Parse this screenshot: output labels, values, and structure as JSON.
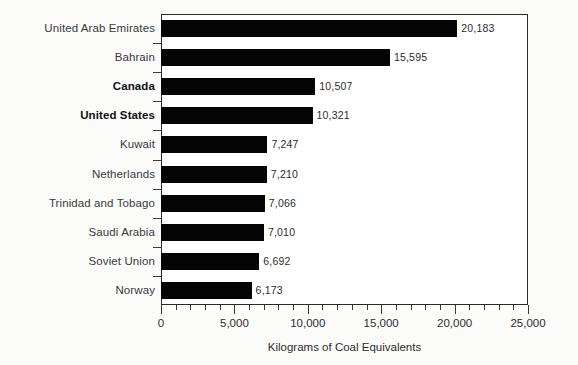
{
  "chart_data": {
    "type": "bar",
    "orientation": "horizontal",
    "title": "",
    "subtitle": "",
    "xlabel": "Kilograms of Coal Equivalents",
    "ylabel": "",
    "xlim": [
      0,
      25000
    ],
    "xtick_labels": [
      "0",
      "5,000",
      "10,000",
      "15,000",
      "20,000",
      "25,000"
    ],
    "xtick_values": [
      0,
      5000,
      10000,
      15000,
      20000,
      25000
    ],
    "minor_tick_interval": 1000,
    "grid": false,
    "legend": null,
    "bar_color": "#050505",
    "categories": [
      "United Arab Emirates",
      "Bahrain",
      "Canada",
      "United States",
      "Kuwait",
      "Netherlands",
      "Trinidad and Tobago",
      "Saudi Arabia",
      "Soviet Union",
      "Norway"
    ],
    "values": [
      20183,
      15595,
      10507,
      10321,
      7247,
      7210,
      7066,
      7010,
      6692,
      6173
    ],
    "value_labels": [
      "20,183",
      "15,595",
      "10,507",
      "10,321",
      "7,247",
      "7,210",
      "7,066",
      "7,010",
      "6,692",
      "6,173"
    ],
    "emphasized_categories": [
      "Canada",
      "United States"
    ]
  }
}
